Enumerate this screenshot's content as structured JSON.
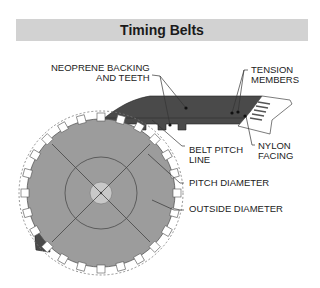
{
  "title": "Timing Belts",
  "labels": {
    "neoprene_line1": "NEOPRENE BACKING",
    "neoprene_line2": "AND TEETH",
    "tension_line1": "TENSION",
    "tension_line2": "MEMBERS",
    "nylon_line1": "NYLON",
    "nylon_line2": "FACING",
    "belt_pitch_line1": "BELT PITCH",
    "belt_pitch_line2": "LINE",
    "pitch_diameter": "PITCH DIAMETER",
    "outside_diameter": "OUTSIDE DIAMETER"
  },
  "colors": {
    "title_band": "#d2d2d2",
    "belt": "#4a4a4a",
    "pulley": "#9c9c9c",
    "hub": "#c8c8c8",
    "facing": "#ffffff"
  }
}
